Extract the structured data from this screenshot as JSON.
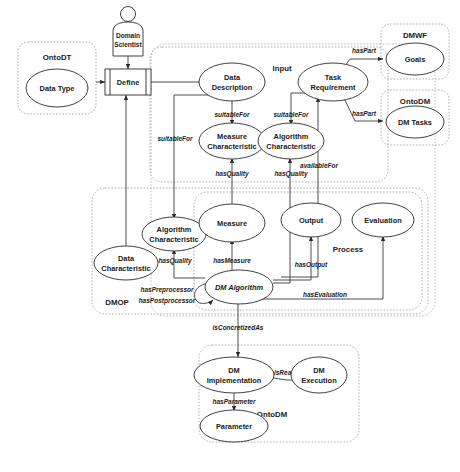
{
  "figure": {
    "caption": "",
    "actor": {
      "name": "domain-scientist",
      "line1": "Domain",
      "line2": "Scientist"
    },
    "process_box": {
      "label": "Define"
    }
  },
  "groups": [
    {
      "id": "ontodt",
      "label": "OntoDT"
    },
    {
      "id": "input",
      "label": "Input"
    },
    {
      "id": "dmwf",
      "label": "DMWF"
    },
    {
      "id": "ontodm-tasks",
      "label": "OntoDM"
    },
    {
      "id": "dmop",
      "label": "DMOP"
    },
    {
      "id": "process",
      "label": "Process"
    },
    {
      "id": "ontodm-impl",
      "label": "OntoDM"
    },
    {
      "id": "ontodm-outer",
      "label": ""
    }
  ],
  "nodes": [
    {
      "id": "data-type",
      "label_line1": "Data Type",
      "label_line2": ""
    },
    {
      "id": "data-description",
      "label_line1": "Data",
      "label_line2": "Description"
    },
    {
      "id": "task-requirement",
      "label_line1": "Task",
      "label_line2": "Requirement"
    },
    {
      "id": "measure-characteristic",
      "label_line1": "Measure",
      "label_line2": "Characteristic"
    },
    {
      "id": "algorithm-characteristic-input",
      "label_line1": "Algorithm",
      "label_line2": "Characteristic"
    },
    {
      "id": "goals",
      "label_line1": "Goals",
      "label_line2": ""
    },
    {
      "id": "dm-tasks",
      "label_line1": "DM Tasks",
      "label_line2": ""
    },
    {
      "id": "algorithm-characteristic-dmop",
      "label_line1": "Algorithm",
      "label_line2": "Characteristic"
    },
    {
      "id": "data-characteristic",
      "label_line1": "Data",
      "label_line2": "Characteristic"
    },
    {
      "id": "measure",
      "label_line1": "Measure",
      "label_line2": ""
    },
    {
      "id": "output",
      "label_line1": "Output",
      "label_line2": ""
    },
    {
      "id": "evaluation",
      "label_line1": "Evaluation",
      "label_line2": ""
    },
    {
      "id": "dm-algorithm",
      "label_line1": "DM Algorithm",
      "label_line2": ""
    },
    {
      "id": "dm-implementation",
      "label_line1": "DM",
      "label_line2": "Implementation"
    },
    {
      "id": "dm-execution",
      "label_line1": "DM",
      "label_line2": "Execution"
    },
    {
      "id": "parameter",
      "label_line1": "Parameter",
      "label_line2": ""
    }
  ],
  "edges": [
    {
      "id": "e-suitablefor-md",
      "label": "suitableFor"
    },
    {
      "id": "e-suitablefor-ta",
      "label": "suitableFor"
    },
    {
      "id": "e-suitablefor-define",
      "label": "suitableFor"
    },
    {
      "id": "e-haspart-goals",
      "label": "hasPart"
    },
    {
      "id": "e-haspart-tasks",
      "label": "hasPart"
    },
    {
      "id": "e-hasquality-mc",
      "label": "hasQuality"
    },
    {
      "id": "e-hasquality-ac",
      "label": "hasQuality"
    },
    {
      "id": "e-availablefor",
      "label": "availableFor"
    },
    {
      "id": "e-hasquality-dmop",
      "label": "hasQuality"
    },
    {
      "id": "e-hasmeasure",
      "label": "hasMeasure"
    },
    {
      "id": "e-hasoutput",
      "label": "hasOutput"
    },
    {
      "id": "e-hasevaluation",
      "label": "hasEvaluation"
    },
    {
      "id": "e-haspreprocessor",
      "label": "hasPreprocessor"
    },
    {
      "id": "e-haspostprocessor",
      "label": "hasPostprocessor"
    },
    {
      "id": "e-isconcretizedas",
      "label": "isConcretizedAs"
    },
    {
      "id": "e-isrealizedby",
      "label": "isRealizedBy"
    },
    {
      "id": "e-hasparameter",
      "label": "hasParameter"
    }
  ],
  "colors": {
    "node_stroke": "#2b2b2b",
    "group_stroke": "#9a9a9a",
    "link_stroke": "#3a3a3a",
    "background": "#ffffff",
    "text": "#1a1a1a"
  }
}
